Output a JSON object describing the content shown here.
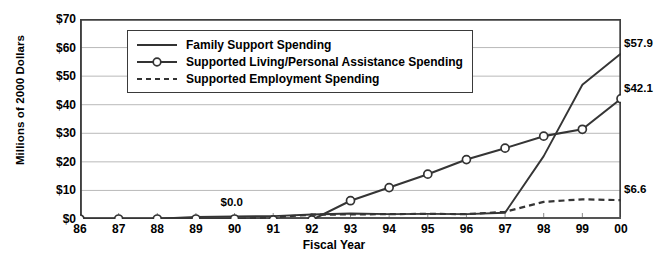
{
  "chart_data": {
    "type": "line",
    "title": "",
    "xlabel": "Fiscal Year",
    "ylabel": "Millions of 2000 Dollars",
    "categories": [
      "86",
      "87",
      "88",
      "89",
      "90",
      "91",
      "92",
      "93",
      "94",
      "95",
      "96",
      "97",
      "98",
      "99",
      "00"
    ],
    "ylim": [
      0,
      70
    ],
    "ytick_labels": [
      "$0",
      "$10",
      "$20",
      "$30",
      "$40",
      "$50",
      "$60",
      "$70"
    ],
    "ytick_values": [
      0,
      10,
      20,
      30,
      40,
      50,
      60,
      70
    ],
    "grid": true,
    "legend_position": "upper-left-inside",
    "series": [
      {
        "name": "Family Support Spending",
        "style": "solid",
        "markers": false,
        "values": [
          0.0,
          0.0,
          0.1,
          0.7,
          0.9,
          1.0,
          1.6,
          1.9,
          1.7,
          1.8,
          1.7,
          2.2,
          22.0,
          47.0,
          57.9
        ]
      },
      {
        "name": "Supported Living/Personal Assistance Spending",
        "style": "solid-markers",
        "markers": true,
        "values": [
          0.0,
          0.0,
          0.0,
          0.0,
          0.0,
          -0.3,
          -0.3,
          6.4,
          11.0,
          15.7,
          20.8,
          24.8,
          29.0,
          31.4,
          42.1
        ]
      },
      {
        "name": "Supported Employment Spending",
        "style": "dashed",
        "markers": false,
        "values": [
          0.0,
          0.0,
          0.0,
          0.0,
          0.0,
          0.6,
          1.5,
          1.6,
          1.7,
          1.8,
          1.7,
          2.5,
          6.0,
          6.9,
          6.6
        ]
      }
    ],
    "annotations": [
      {
        "text": "$0.0",
        "x_index": 4,
        "value": 3.2,
        "anchor": "above"
      },
      {
        "text": "$57.9",
        "x_index": 14,
        "value": 57.9,
        "anchor": "right"
      },
      {
        "text": "$42.1",
        "x_index": 14,
        "value": 42.1,
        "anchor": "right"
      },
      {
        "text": "$6.6",
        "x_index": 14,
        "value": 6.6,
        "anchor": "right"
      }
    ]
  }
}
